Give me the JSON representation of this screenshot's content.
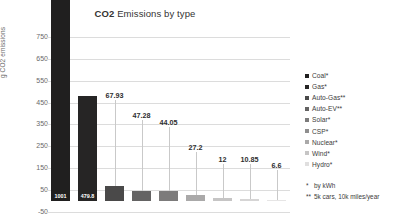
{
  "chart_data": {
    "type": "bar",
    "title": "CO2 Emissions by type",
    "title_bold_part": "CO2",
    "title_rest": " Emissions by type",
    "xlabel": "",
    "ylabel": "g CO2 emissions",
    "ylim": [
      -50,
      800
    ],
    "grid": true,
    "legend_position": "right",
    "categories": [
      "Coal*",
      "Gas*",
      "Auto-Gas**",
      "Auto-EV**",
      "Solar*",
      "CSP*",
      "Nuclear*",
      "Wind*",
      "Hydro*"
    ],
    "values": [
      1001,
      479.8,
      67.93,
      47.28,
      44.05,
      27.2,
      12,
      10.85,
      6.6
    ],
    "value_labels": [
      "1001",
      "479.8",
      "67.93",
      "47.28",
      "44.05",
      "27.2",
      "12",
      "10.85",
      "6.6"
    ],
    "bar_colors": [
      "#201f1f",
      "#262525",
      "#4a4949",
      "#646363",
      "#7c7b7b",
      "#aaa9a9",
      "#c6c5c5",
      "#d6d5d5",
      "#e6e5e5"
    ],
    "yticks": [
      750,
      650,
      550,
      450,
      350,
      250,
      150,
      50,
      -50
    ],
    "ytick_labels": [
      "750",
      "650",
      "550",
      "450",
      "350",
      "250",
      "150",
      "50",
      "-50"
    ],
    "annotations": [
      "*   by kWh",
      "** 5k cars, 10k miles/year"
    ]
  },
  "legend": {
    "items": [
      {
        "label": "Coal*",
        "color": "#201f1f"
      },
      {
        "label": "Gas*",
        "color": "#262525"
      },
      {
        "label": "Auto-Gas**",
        "color": "#4a4949"
      },
      {
        "label": "Auto-EV**",
        "color": "#646363"
      },
      {
        "label": "Solar*",
        "color": "#7c7b7b"
      },
      {
        "label": "CSP*",
        "color": "#8f8e8e"
      },
      {
        "label": "Nuclear*",
        "color": "#aaa9a9"
      },
      {
        "label": "Wind*",
        "color": "#c6c5c5"
      },
      {
        "label": "Hydro*",
        "color": "#e0dfdf"
      }
    ]
  },
  "footnotes": {
    "kwh_mark": "*",
    "kwh_text": "by kWh",
    "cars_mark": "**",
    "cars_text": "5k cars, 10k miles/year"
  }
}
